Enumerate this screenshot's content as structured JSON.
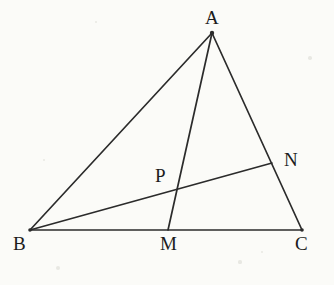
{
  "figure": {
    "kind": "euclidean-geometry-diagram",
    "background_color": "#fbfbf8",
    "stroke_color": "#2b2b2b",
    "label_color": "#1c1c1c",
    "width": 334,
    "height": 285
  },
  "points": [
    {
      "id": "A",
      "label": "A",
      "x": 212,
      "y": 33,
      "label_x": 205,
      "label_y": 8,
      "on": "apex"
    },
    {
      "id": "B",
      "label": "B",
      "x": 30,
      "y": 230,
      "label_x": 13,
      "label_y": 234,
      "on": "base-left"
    },
    {
      "id": "C",
      "label": "C",
      "x": 302,
      "y": 230,
      "label_x": 295,
      "label_y": 234,
      "on": "base-right"
    },
    {
      "id": "M",
      "label": "M",
      "x": 168,
      "y": 230,
      "label_x": 160,
      "label_y": 234,
      "on": "segment-BC"
    },
    {
      "id": "N",
      "label": "N",
      "x": 272,
      "y": 163,
      "label_x": 284,
      "label_y": 150,
      "on": "segment-AC"
    },
    {
      "id": "P",
      "label": "P",
      "x": 176,
      "y": 190,
      "label_x": 155,
      "label_y": 166,
      "on": "intersection-AM-BN"
    }
  ],
  "segments": [
    {
      "id": "AB",
      "name": "segment-ab",
      "from": "A",
      "to": "B",
      "x1": 212,
      "y1": 33,
      "x2": 30,
      "y2": 230
    },
    {
      "id": "AC",
      "name": "segment-ac",
      "from": "A",
      "to": "C",
      "x1": 212,
      "y1": 33,
      "x2": 302,
      "y2": 230
    },
    {
      "id": "BC",
      "name": "segment-bc",
      "from": "B",
      "to": "C",
      "x1": 30,
      "y1": 230,
      "x2": 302,
      "y2": 230
    },
    {
      "id": "AM",
      "name": "segment-am",
      "from": "A",
      "to": "M",
      "x1": 212,
      "y1": 33,
      "x2": 168,
      "y2": 230
    },
    {
      "id": "BN",
      "name": "segment-bn",
      "from": "B",
      "to": "N",
      "x1": 30,
      "y1": 230,
      "x2": 272,
      "y2": 163
    }
  ],
  "specks": [
    {
      "x": 58,
      "y": 268,
      "r": 2.0
    },
    {
      "x": 240,
      "y": 262,
      "r": 1.6
    },
    {
      "x": 96,
      "y": 22,
      "r": 1.4
    },
    {
      "x": 310,
      "y": 58,
      "r": 1.8
    },
    {
      "x": 44,
      "y": 160,
      "r": 1.2
    },
    {
      "x": 262,
      "y": 252,
      "r": 1.3
    }
  ]
}
